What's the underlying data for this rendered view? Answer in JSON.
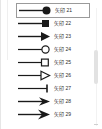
{
  "panel": {
    "name": "arrow-style-gallery",
    "background_color": "#ffffff",
    "selection_border_color": "#9a9a9a",
    "line_color": "#1a1a1a"
  },
  "scrollbar": {
    "name": "vertical-scrollbar",
    "thumb_color": "#e2e2e2"
  },
  "items": [
    {
      "label": "矢印 21",
      "end_marker": "filled-circle",
      "selected": true
    },
    {
      "label": "矢印 22",
      "end_marker": "filled-square",
      "selected": false
    },
    {
      "label": "矢印 23",
      "end_marker": "filled-triangle",
      "selected": false
    },
    {
      "label": "矢印 24",
      "end_marker": "hollow-circle",
      "selected": false
    },
    {
      "label": "矢印 25",
      "end_marker": "hollow-square",
      "selected": false
    },
    {
      "label": "矢印 26",
      "end_marker": "hollow-triangle",
      "selected": false
    },
    {
      "label": "矢印 27",
      "end_marker": "bar-tick",
      "selected": false
    },
    {
      "label": "矢印 28",
      "end_marker": "open-arrow",
      "selected": false
    },
    {
      "label": "矢印 29",
      "end_marker": "stealth-arrow",
      "selected": false
    }
  ]
}
